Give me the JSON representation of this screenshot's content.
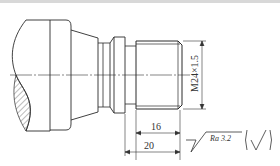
{
  "drawing": {
    "type": "shaft-thread-detail",
    "thread_label": "M24×1.5",
    "dimensions": [
      {
        "id": "thread_length",
        "value": "16"
      },
      {
        "id": "total_length",
        "value": "20"
      }
    ],
    "surface_roughness": {
      "label": "Ra 3.2",
      "other_symbol": "(√)"
    },
    "colors": {
      "line": "#2b2b2b",
      "background": "#ffffff",
      "hatch": "#555555"
    }
  }
}
